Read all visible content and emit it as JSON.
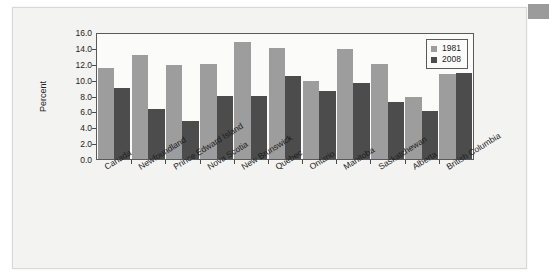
{
  "chart_data": {
    "type": "bar",
    "title": "",
    "xlabel": "",
    "ylabel": "Percent",
    "ylim": [
      0.0,
      16.0
    ],
    "ytick_step": 2.0,
    "yticks": [
      "16.0",
      "14.0",
      "12.0",
      "10.0",
      "8.0",
      "6.0",
      "4.0",
      "2.0",
      "0.0"
    ],
    "ytick_values": [
      16.0,
      14.0,
      12.0,
      10.0,
      8.0,
      6.0,
      4.0,
      2.0,
      0.0
    ],
    "grid": false,
    "legend_position": "top-right",
    "categories": [
      "Canada",
      "Newfoundland",
      "Prince Edward Island",
      "Nova Scotia",
      "New Brunswick",
      "Quebec",
      "Ontario",
      "Manitoba",
      "Saskatchewan",
      "Alberta",
      "British Columbia"
    ],
    "series": [
      {
        "name": "1981",
        "color": "#9d9d9d",
        "values": [
          11.6,
          13.3,
          12.0,
          12.1,
          15.0,
          14.2,
          10.0,
          14.1,
          12.1,
          8.0,
          10.9
        ]
      },
      {
        "name": "2008",
        "color": "#4c4c4c",
        "values": [
          9.1,
          6.4,
          4.9,
          8.1,
          8.1,
          10.6,
          8.7,
          9.7,
          7.3,
          6.1,
          11.0
        ]
      }
    ]
  },
  "legend": {
    "entries": [
      {
        "label": "1981"
      },
      {
        "label": "2008"
      }
    ]
  },
  "colors": {
    "series_1981": "#9d9d9d",
    "series_2008": "#4c4c4c",
    "plot_background": "#fbfbfa",
    "card_background": "#f3f3f1",
    "axis": "#5a5a5a",
    "corner_tab": "#9b9b9b"
  }
}
